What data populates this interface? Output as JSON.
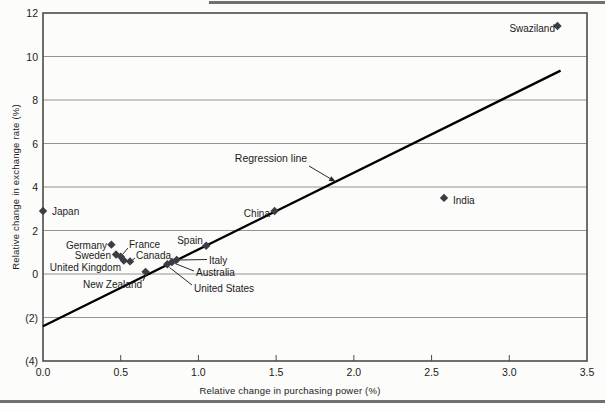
{
  "figure": {
    "background": "#fcfcfa",
    "rule_color": "#707070"
  },
  "chart_data": {
    "type": "scatter",
    "title": "",
    "xlabel": "Relative change in purchasing power (%)",
    "ylabel": "Relative change in exchange rate (%)",
    "xlim": [
      0,
      3.5
    ],
    "ylim": [
      -4,
      12
    ],
    "xtick_values": [
      0,
      0.5,
      1.0,
      1.5,
      2.0,
      2.5,
      3.0,
      3.5
    ],
    "xtick_labels": [
      "0.0",
      "0.5",
      "1.0",
      "1.5",
      "2.0",
      "2.5",
      "3.0",
      "3.5"
    ],
    "ytick_values": [
      12,
      10,
      8,
      6,
      4,
      2,
      0,
      -2,
      -4
    ],
    "ytick_labels": [
      "12",
      "10",
      "8",
      "6",
      "4",
      "2",
      "0",
      "(2)",
      "(4)"
    ],
    "gridline_values": [
      10,
      8,
      6,
      4,
      2,
      0,
      -2
    ],
    "grid_on": true,
    "grid_color": "#949494",
    "border_color": "#4b4b4b",
    "point_color": "#3c3c44",
    "line_color": "#000000",
    "leader_color": "#2a2a2a",
    "text_color": "#1b1b1b",
    "points": [
      {
        "country": "Japan",
        "x": 0.0,
        "y": 2.9,
        "anchor": "start",
        "label_px": [
          9,
          198
        ]
      },
      {
        "country": "Germany",
        "x": 0.44,
        "y": 1.35,
        "anchor": "end",
        "label_px": [
          64,
          232
        ]
      },
      {
        "country": "Sweden",
        "x": 0.47,
        "y": 0.9,
        "anchor": "end",
        "label_px": [
          68,
          242
        ]
      },
      {
        "country": "France",
        "x": 0.5,
        "y": 0.8,
        "anchor": "start",
        "label_px": [
          86,
          231
        ],
        "leader": [
          [
            85,
            235
          ],
          [
            79.5,
            241.5
          ]
        ]
      },
      {
        "country": "United Kingdom",
        "x": 0.52,
        "y": 0.62,
        "anchor": "end",
        "label_px": [
          78,
          254
        ]
      },
      {
        "country": "Canada",
        "x": 0.56,
        "y": 0.58,
        "anchor": "start",
        "label_px": [
          93,
          242
        ],
        "leader": [
          [
            92,
            245
          ],
          [
            88.5,
            248
          ]
        ]
      },
      {
        "country": "New Zealand",
        "x": 0.66,
        "y": 0.1,
        "anchor": "end",
        "label_px": [
          99,
          271
        ],
        "leader": [
          [
            100,
            268
          ],
          [
            102.5,
            262.5
          ]
        ]
      },
      {
        "country": "United States",
        "x": 0.8,
        "y": 0.45,
        "anchor": "start",
        "label_px": [
          151,
          275
        ],
        "leader": [
          [
            149,
            272
          ],
          [
            126.5,
            254.5
          ]
        ]
      },
      {
        "country": "Australia",
        "x": 0.83,
        "y": 0.55,
        "anchor": "start",
        "label_px": [
          153,
          259
        ],
        "leader": [
          [
            151,
            258
          ],
          [
            132,
            250.5
          ]
        ]
      },
      {
        "country": "Italy",
        "x": 0.86,
        "y": 0.65,
        "anchor": "start",
        "label_px": [
          166,
          247
        ],
        "leader": [
          [
            164,
            246.5
          ],
          [
            137.5,
            247
          ]
        ]
      },
      {
        "country": "Spain",
        "x": 1.05,
        "y": 1.3,
        "anchor": "middle",
        "label_px": [
          147,
          227
        ]
      },
      {
        "country": "China",
        "x": 1.49,
        "y": 2.9,
        "anchor": "end",
        "label_px": [
          227,
          200
        ]
      },
      {
        "country": "India",
        "x": 2.58,
        "y": 3.5,
        "anchor": "start",
        "label_px": [
          410,
          187
        ]
      },
      {
        "country": "Swaziland",
        "x": 3.31,
        "y": 11.4,
        "anchor": "end",
        "label_px": [
          512,
          15
        ]
      }
    ],
    "regression_line": {
      "x1": 0,
      "y1": -2.4,
      "x2": 3.33,
      "y2": 9.35
    },
    "annotation": {
      "text": "Regression line",
      "text_px": [
        228,
        145
      ],
      "arrow_from": [
        266,
        153
      ],
      "arrow_to": [
        293,
        169
      ]
    }
  }
}
